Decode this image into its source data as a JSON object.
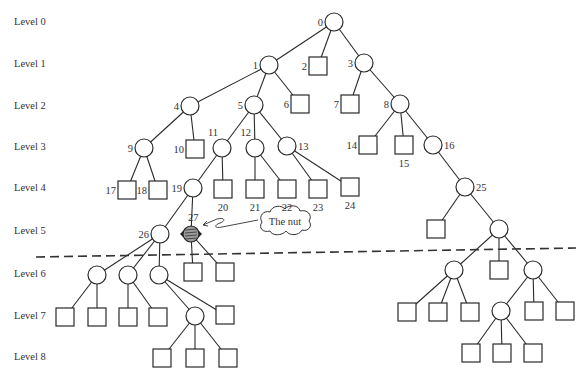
{
  "diagram": {
    "type": "game-tree",
    "levels": [
      {
        "label": "Level 0",
        "y": 23
      },
      {
        "label": "Level 1",
        "y": 65
      },
      {
        "label": "Level 2",
        "y": 107
      },
      {
        "label": "Level 3",
        "y": 148
      },
      {
        "label": "Level 4",
        "y": 189
      },
      {
        "label": "Level 5",
        "y": 232
      },
      {
        "label": "Level 6",
        "y": 275
      },
      {
        "label": "Level 7",
        "y": 317
      },
      {
        "label": "Level 8",
        "y": 358
      }
    ],
    "callout": {
      "text": "The nut",
      "target_node": "27"
    },
    "cutoff_line": {
      "style": "dashed",
      "between_levels": [
        5,
        6
      ]
    },
    "nodes": [
      {
        "id": "0",
        "shape": "circle",
        "x": 334,
        "y": 22,
        "label": "0",
        "label_side": "left"
      },
      {
        "id": "1",
        "shape": "circle",
        "x": 269,
        "y": 65,
        "label": "1",
        "label_side": "left"
      },
      {
        "id": "2",
        "shape": "square",
        "x": 318,
        "y": 66,
        "label": "2",
        "label_side": "left"
      },
      {
        "id": "3",
        "shape": "circle",
        "x": 364,
        "y": 63,
        "label": "3",
        "label_side": "left"
      },
      {
        "id": "4",
        "shape": "circle",
        "x": 190,
        "y": 106,
        "label": "4",
        "label_side": "left"
      },
      {
        "id": "5",
        "shape": "circle",
        "x": 254,
        "y": 105,
        "label": "5",
        "label_side": "left"
      },
      {
        "id": "6",
        "shape": "square",
        "x": 300,
        "y": 104,
        "label": "6",
        "label_side": "left"
      },
      {
        "id": "7",
        "shape": "square",
        "x": 350,
        "y": 104,
        "label": "7",
        "label_side": "left"
      },
      {
        "id": "8",
        "shape": "circle",
        "x": 400,
        "y": 104,
        "label": "8",
        "label_side": "left"
      },
      {
        "id": "9",
        "shape": "circle",
        "x": 144,
        "y": 148,
        "label": "9",
        "label_side": "left"
      },
      {
        "id": "10",
        "shape": "square",
        "x": 195,
        "y": 149,
        "label": "10",
        "label_side": "left"
      },
      {
        "id": "11",
        "shape": "circle",
        "x": 222,
        "y": 148,
        "label": "11",
        "label_side": "top-left"
      },
      {
        "id": "12",
        "shape": "circle",
        "x": 255,
        "y": 148,
        "label": "12",
        "label_side": "top-left"
      },
      {
        "id": "13",
        "shape": "circle",
        "x": 287,
        "y": 146,
        "label": "13",
        "label_side": "right"
      },
      {
        "id": "14",
        "shape": "square",
        "x": 368,
        "y": 145,
        "label": "14",
        "label_side": "left"
      },
      {
        "id": "15",
        "shape": "square",
        "x": 404,
        "y": 145,
        "label": "15",
        "label_side": "bottom"
      },
      {
        "id": "16",
        "shape": "circle",
        "x": 433,
        "y": 145,
        "label": "16",
        "label_side": "right"
      },
      {
        "id": "17",
        "shape": "square",
        "x": 127,
        "y": 190,
        "label": "17",
        "label_side": "left"
      },
      {
        "id": "18",
        "shape": "square",
        "x": 158,
        "y": 190,
        "label": "18",
        "label_side": "left"
      },
      {
        "id": "19",
        "shape": "circle",
        "x": 193,
        "y": 188,
        "label": "19",
        "label_side": "left"
      },
      {
        "id": "20",
        "shape": "square",
        "x": 223,
        "y": 189,
        "label": "20",
        "label_side": "bottom"
      },
      {
        "id": "21",
        "shape": "square",
        "x": 255,
        "y": 189,
        "label": "21",
        "label_side": "bottom"
      },
      {
        "id": "22",
        "shape": "square",
        "x": 287,
        "y": 189,
        "label": "22",
        "label_side": "bottom"
      },
      {
        "id": "23",
        "shape": "square",
        "x": 318,
        "y": 189,
        "label": "23",
        "label_side": "bottom"
      },
      {
        "id": "24",
        "shape": "square",
        "x": 350,
        "y": 187,
        "label": "24",
        "label_side": "bottom"
      },
      {
        "id": "25",
        "shape": "circle",
        "x": 465,
        "y": 187,
        "label": "25",
        "label_side": "right"
      },
      {
        "id": "26",
        "shape": "circle",
        "x": 160,
        "y": 234,
        "label": "26",
        "label_side": "left"
      },
      {
        "id": "27",
        "shape": "nut",
        "x": 191,
        "y": 234,
        "label": "27",
        "label_side": "top-right"
      },
      {
        "id": "r5s",
        "shape": "square",
        "x": 436,
        "y": 229,
        "label": ""
      },
      {
        "id": "r5c",
        "shape": "circle",
        "x": 499,
        "y": 229,
        "label": ""
      },
      {
        "id": "l6a",
        "shape": "circle",
        "x": 97,
        "y": 275,
        "label": ""
      },
      {
        "id": "l6b",
        "shape": "circle",
        "x": 128,
        "y": 275,
        "label": ""
      },
      {
        "id": "l6c",
        "shape": "circle",
        "x": 159,
        "y": 275,
        "label": ""
      },
      {
        "id": "l6d",
        "shape": "square",
        "x": 193,
        "y": 272,
        "label": ""
      },
      {
        "id": "l6e",
        "shape": "square",
        "x": 225,
        "y": 272,
        "label": ""
      },
      {
        "id": "r6a",
        "shape": "circle",
        "x": 454,
        "y": 270,
        "label": ""
      },
      {
        "id": "r6b",
        "shape": "square",
        "x": 499,
        "y": 270,
        "label": ""
      },
      {
        "id": "r6c",
        "shape": "circle",
        "x": 533,
        "y": 270,
        "label": ""
      },
      {
        "id": "l7a",
        "shape": "square",
        "x": 65,
        "y": 317,
        "label": ""
      },
      {
        "id": "l7b",
        "shape": "square",
        "x": 97,
        "y": 317,
        "label": ""
      },
      {
        "id": "l7c",
        "shape": "square",
        "x": 128,
        "y": 317,
        "label": ""
      },
      {
        "id": "l7d",
        "shape": "square",
        "x": 158,
        "y": 317,
        "label": ""
      },
      {
        "id": "l7e",
        "shape": "circle",
        "x": 195,
        "y": 316,
        "label": ""
      },
      {
        "id": "l7f",
        "shape": "square",
        "x": 225,
        "y": 315,
        "label": ""
      },
      {
        "id": "r7a",
        "shape": "square",
        "x": 407,
        "y": 312,
        "label": ""
      },
      {
        "id": "r7b",
        "shape": "square",
        "x": 438,
        "y": 312,
        "label": ""
      },
      {
        "id": "r7c",
        "shape": "square",
        "x": 470,
        "y": 312,
        "label": ""
      },
      {
        "id": "r7d",
        "shape": "circle",
        "x": 501,
        "y": 311,
        "label": ""
      },
      {
        "id": "r7e",
        "shape": "square",
        "x": 534,
        "y": 311,
        "label": ""
      },
      {
        "id": "r7f",
        "shape": "square",
        "x": 565,
        "y": 311,
        "label": ""
      },
      {
        "id": "l8a",
        "shape": "square",
        "x": 162,
        "y": 358,
        "label": ""
      },
      {
        "id": "l8b",
        "shape": "square",
        "x": 195,
        "y": 358,
        "label": ""
      },
      {
        "id": "l8c",
        "shape": "square",
        "x": 228,
        "y": 358,
        "label": ""
      },
      {
        "id": "r8a",
        "shape": "square",
        "x": 471,
        "y": 353,
        "label": ""
      },
      {
        "id": "r8b",
        "shape": "square",
        "x": 502,
        "y": 353,
        "label": ""
      },
      {
        "id": "r8c",
        "shape": "square",
        "x": 533,
        "y": 353,
        "label": ""
      }
    ],
    "edges": [
      [
        "0",
        "1"
      ],
      [
        "0",
        "2"
      ],
      [
        "0",
        "3"
      ],
      [
        "1",
        "4"
      ],
      [
        "1",
        "5"
      ],
      [
        "1",
        "6"
      ],
      [
        "3",
        "7"
      ],
      [
        "3",
        "8"
      ],
      [
        "4",
        "9"
      ],
      [
        "4",
        "10"
      ],
      [
        "5",
        "11"
      ],
      [
        "5",
        "12"
      ],
      [
        "5",
        "13"
      ],
      [
        "8",
        "14"
      ],
      [
        "8",
        "15"
      ],
      [
        "8",
        "16"
      ],
      [
        "9",
        "17"
      ],
      [
        "9",
        "18"
      ],
      [
        "11",
        "19"
      ],
      [
        "11",
        "20"
      ],
      [
        "12",
        "21"
      ],
      [
        "12",
        "22"
      ],
      [
        "13",
        "23"
      ],
      [
        "13",
        "24"
      ],
      [
        "16",
        "25"
      ],
      [
        "19",
        "26"
      ],
      [
        "19",
        "27"
      ],
      [
        "25",
        "r5s"
      ],
      [
        "25",
        "r5c"
      ],
      [
        "26",
        "l6a"
      ],
      [
        "26",
        "l6b"
      ],
      [
        "26",
        "l6c"
      ],
      [
        "27",
        "l6d"
      ],
      [
        "27",
        "l6e"
      ],
      [
        "r5c",
        "r6a"
      ],
      [
        "r5c",
        "r6b"
      ],
      [
        "r5c",
        "r6c"
      ],
      [
        "l6a",
        "l7a"
      ],
      [
        "l6a",
        "l7b"
      ],
      [
        "l6b",
        "l7c"
      ],
      [
        "l6b",
        "l7d"
      ],
      [
        "l6c",
        "l7e"
      ],
      [
        "l6c",
        "l7f"
      ],
      [
        "r6a",
        "r7a"
      ],
      [
        "r6a",
        "r7b"
      ],
      [
        "r6a",
        "r7c"
      ],
      [
        "r6c",
        "r7d"
      ],
      [
        "r6c",
        "r7e"
      ],
      [
        "r6c",
        "r7f"
      ],
      [
        "l7e",
        "l8a"
      ],
      [
        "l7e",
        "l8b"
      ],
      [
        "l7e",
        "l8c"
      ],
      [
        "r7d",
        "r8a"
      ],
      [
        "r7d",
        "r8b"
      ],
      [
        "r7d",
        "r8c"
      ]
    ]
  }
}
